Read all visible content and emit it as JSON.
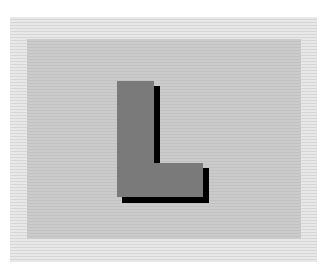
{
  "figure": {
    "glyph": "L",
    "colors": {
      "background": "#ffffff",
      "outer_band": "#e0e0e0",
      "inner_panel": "#c8c8c8",
      "glyph_fill": "#7a7a7a",
      "glyph_shadow": "#000000"
    }
  }
}
